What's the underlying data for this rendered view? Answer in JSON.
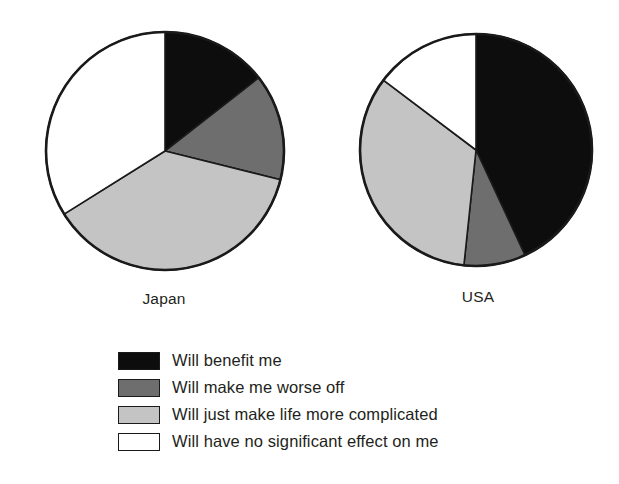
{
  "chart_data": {
    "type": "pie",
    "title": "",
    "categories": [
      "Will benefit me",
      "Will make me worse off",
      "Will just make life more complicated",
      "Will have no significant effect on me"
    ],
    "colors": [
      "#0d0d0d",
      "#6e6e6e",
      "#c4c4c4",
      "#ffffff"
    ],
    "legend_position": "bottom-center",
    "grid": false,
    "series": [
      {
        "name": "Japan",
        "label": "Japan",
        "values": [
          14.4,
          14.4,
          37.2,
          34.0
        ],
        "start_angles_deg": [
          0,
          52,
          104,
          238
        ],
        "end_angles_deg": [
          52,
          104,
          238,
          360
        ],
        "center": {
          "x": 164,
          "y": 152
        },
        "radius": 119
      },
      {
        "name": "USA",
        "label": "USA",
        "values": [
          43.1,
          8.6,
          33.6,
          14.7
        ],
        "start_angles_deg": [
          0,
          155,
          186,
          307
        ],
        "end_angles_deg": [
          155,
          186,
          307,
          360
        ],
        "center": {
          "x": 477,
          "y": 152
        },
        "radius": 116
      }
    ]
  },
  "legend": {
    "items": [
      {
        "label": "Will benefit me",
        "color": "#0d0d0d"
      },
      {
        "label": "Will make me worse off",
        "color": "#6e6e6e"
      },
      {
        "label": "Will just make life more complicated",
        "color": "#c4c4c4"
      },
      {
        "label": "Will have no significant effect on me",
        "color": "#ffffff"
      }
    ]
  },
  "labels": {
    "japan": "Japan",
    "usa": "USA"
  },
  "style": {
    "outline_color": "#1a1a1a",
    "background": "#ffffff",
    "text_color": "#231f20"
  }
}
